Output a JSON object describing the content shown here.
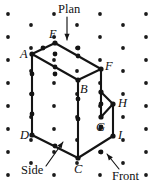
{
  "figure": {
    "canvas": {
      "width": 156,
      "height": 184
    },
    "background_color": "#ffffff",
    "line_color": "#141414",
    "dot_color": "#1a1a1a"
  },
  "lattice": {
    "description": "isometric dot grid",
    "dot_radius": 1.9,
    "dots": [
      [
        8,
        14
      ],
      [
        54,
        14
      ],
      [
        100,
        14
      ],
      [
        146,
        14
      ],
      [
        31,
        25
      ],
      [
        77,
        25
      ],
      [
        123,
        25
      ],
      [
        8,
        37
      ],
      [
        54,
        37
      ],
      [
        100,
        37
      ],
      [
        146,
        37
      ],
      [
        31,
        48
      ],
      [
        77,
        48
      ],
      [
        123,
        48
      ],
      [
        8,
        60
      ],
      [
        54,
        60
      ],
      [
        100,
        60
      ],
      [
        146,
        60
      ],
      [
        31,
        71
      ],
      [
        77,
        71
      ],
      [
        123,
        71
      ],
      [
        8,
        83
      ],
      [
        54,
        83
      ],
      [
        100,
        83
      ],
      [
        146,
        83
      ],
      [
        31,
        94
      ],
      [
        77,
        94
      ],
      [
        123,
        94
      ],
      [
        8,
        106
      ],
      [
        54,
        106
      ],
      [
        100,
        106
      ],
      [
        146,
        106
      ],
      [
        31,
        117
      ],
      [
        77,
        117
      ],
      [
        123,
        117
      ],
      [
        8,
        129
      ],
      [
        54,
        129
      ],
      [
        100,
        129
      ],
      [
        146,
        129
      ],
      [
        31,
        140
      ],
      [
        77,
        140
      ],
      [
        123,
        140
      ],
      [
        8,
        152
      ],
      [
        54,
        152
      ],
      [
        100,
        152
      ],
      [
        146,
        152
      ],
      [
        31,
        163
      ],
      [
        77,
        163
      ],
      [
        123,
        163
      ],
      [
        8,
        175
      ],
      [
        54,
        175
      ],
      [
        100,
        175
      ],
      [
        146,
        175
      ]
    ]
  },
  "solid": {
    "name": "notched rectangular block",
    "vertices": {
      "A": {
        "x": 32,
        "y": 54,
        "label": "A",
        "label_x": 20,
        "label_y": 58
      },
      "B": {
        "x": 78,
        "y": 80,
        "label": "B",
        "label_x": 80,
        "label_y": 93
      },
      "C": {
        "x": 78,
        "y": 158,
        "label": "C",
        "label_x": 74,
        "label_y": 173
      },
      "D": {
        "x": 32,
        "y": 135,
        "label": "D",
        "label_x": 20,
        "label_y": 139
      },
      "E": {
        "x": 55,
        "y": 43,
        "label": "E",
        "label_x": 49,
        "label_y": 38
      },
      "F": {
        "x": 101,
        "y": 69,
        "label": "F",
        "label_x": 105,
        "label_y": 70
      },
      "G": {
        "x": 101,
        "y": 117,
        "label": "G",
        "label_x": 96,
        "label_y": 131
      },
      "H": {
        "x": 113,
        "y": 104,
        "label": "H",
        "label_x": 118,
        "label_y": 107
      },
      "I": {
        "x": 113,
        "y": 136,
        "label": "I",
        "label_x": 118,
        "label_y": 139
      },
      "T": {
        "x": 101,
        "y": 92,
        "label": "",
        "label_x": 0,
        "label_y": 0
      }
    },
    "edges": [
      {
        "from": "A",
        "to": "E",
        "name": "edge-A-E"
      },
      {
        "from": "E",
        "to": "F",
        "name": "edge-E-F"
      },
      {
        "from": "A",
        "to": "B",
        "name": "edge-A-B"
      },
      {
        "from": "B",
        "to": "F",
        "name": "edge-B-F"
      },
      {
        "from": "A",
        "to": "D",
        "name": "edge-A-D"
      },
      {
        "from": "B",
        "to": "C",
        "name": "edge-B-C"
      },
      {
        "from": "D",
        "to": "C",
        "name": "edge-D-C"
      },
      {
        "from": "F",
        "to": "T",
        "name": "edge-F-T"
      },
      {
        "from": "T",
        "to": "H",
        "name": "edge-T-H"
      },
      {
        "from": "T",
        "to": "G",
        "name": "edge-T-G"
      },
      {
        "from": "G",
        "to": "H",
        "name": "edge-G-H"
      },
      {
        "from": "H",
        "to": "I",
        "name": "edge-H-I"
      },
      {
        "from": "C",
        "to": "I",
        "name": "edge-C-I"
      }
    ],
    "edge_midpoint_nodes": [
      [
        43,
        48
      ],
      [
        78,
        56
      ],
      [
        55,
        67
      ],
      [
        32,
        94
      ],
      [
        78,
        119
      ],
      [
        32,
        114
      ],
      [
        55,
        146
      ],
      [
        101,
        104
      ],
      [
        55,
        74
      ],
      [
        101,
        152
      ],
      [
        78,
        48
      ],
      [
        55,
        54
      ],
      [
        32,
        74
      ],
      [
        78,
        99
      ],
      [
        101,
        127
      ]
    ]
  },
  "annotations": [
    {
      "id": "plan",
      "text": "Plan",
      "label_x": 58,
      "label_y": 13,
      "arrow": {
        "x1": 67,
        "y1": 17,
        "x2": 67,
        "y2": 40
      },
      "arrow_direction": "down"
    },
    {
      "id": "side",
      "text": "Side",
      "label_x": 21,
      "label_y": 174,
      "arrow": {
        "x1": 46,
        "y1": 166,
        "x2": 63,
        "y2": 142
      },
      "arrow_direction": "up-right"
    },
    {
      "id": "front",
      "text": "Front",
      "label_x": 112,
      "label_y": 180,
      "arrow": {
        "x1": 119,
        "y1": 169,
        "x2": 107,
        "y2": 154
      },
      "arrow_direction": "up-left"
    }
  ]
}
